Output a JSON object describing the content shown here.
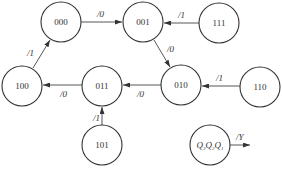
{
  "diagram": {
    "type": "state-transition",
    "states": [
      {
        "id": "s000",
        "label": "000",
        "cx": 61,
        "cy": 22
      },
      {
        "id": "s001",
        "label": "001",
        "cx": 143,
        "cy": 22
      },
      {
        "id": "s111",
        "label": "111",
        "cx": 219,
        "cy": 23
      },
      {
        "id": "s100",
        "label": "100",
        "cx": 22,
        "cy": 86
      },
      {
        "id": "s011",
        "label": "011",
        "cx": 102,
        "cy": 86
      },
      {
        "id": "s010",
        "label": "010",
        "cx": 181,
        "cy": 85
      },
      {
        "id": "s110",
        "label": "110",
        "cx": 260,
        "cy": 87
      },
      {
        "id": "s101",
        "label": "101",
        "cx": 102,
        "cy": 145
      }
    ],
    "transitions": [
      {
        "from": "000",
        "to": "001",
        "label": "/0"
      },
      {
        "from": "111",
        "to": "001",
        "label": "/1"
      },
      {
        "from": "001",
        "to": "010",
        "label": "/0"
      },
      {
        "from": "110",
        "to": "010",
        "label": "/1"
      },
      {
        "from": "010",
        "to": "011",
        "label": "/0"
      },
      {
        "from": "011",
        "to": "100",
        "label": "/0"
      },
      {
        "from": "100",
        "to": "000",
        "label": "/1"
      },
      {
        "from": "101",
        "to": "011",
        "label": "/1"
      }
    ],
    "legend": {
      "state_label": "Q3Q2Q1",
      "output_label": "/Y"
    }
  }
}
